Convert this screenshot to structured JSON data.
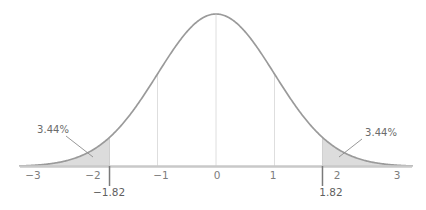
{
  "chart_data": {
    "type": "area",
    "title": "",
    "subtitle": "",
    "xlabel": "",
    "ylabel": "",
    "distribution": "standard-normal",
    "mean": 0,
    "sd": 1,
    "xlim": [
      -3.35,
      3.35
    ],
    "ylim": [
      0,
      0.42
    ],
    "grid": true,
    "grid_lines_at": [
      -1,
      0,
      1
    ],
    "legend": "none",
    "axis_ticks": [
      {
        "value": -3,
        "label": "−3"
      },
      {
        "value": -2,
        "label": "−2"
      },
      {
        "value": -1,
        "label": "−1"
      },
      {
        "value": 0,
        "label": "0"
      },
      {
        "value": 1,
        "label": "1"
      },
      {
        "value": 2,
        "label": "2"
      },
      {
        "value": 3,
        "label": "3"
      }
    ],
    "critical_values": [
      {
        "value": -1.82,
        "label": "−1.82"
      },
      {
        "value": 1.82,
        "label": "1.82"
      }
    ],
    "shaded_regions": [
      {
        "name": "left-tail",
        "from": -3.35,
        "to": -1.82,
        "area_percent": 3.44,
        "label": "3.44%"
      },
      {
        "name": "right-tail",
        "from": 1.82,
        "to": 3.35,
        "area_percent": 3.44,
        "label": "3.44%"
      }
    ],
    "annotations": [
      {
        "name": "left-tail-callout",
        "text": "3.44%",
        "points_to": -1.95
      },
      {
        "name": "right-tail-callout",
        "text": "3.44%",
        "points_to": 1.95
      }
    ],
    "colors": {
      "curve_stroke": "#9a9a9a",
      "tail_fill": "#d9d9d9",
      "axis": "#c9c9c9",
      "grid": "#dcdcdc",
      "tick_text": "#7d7d7d",
      "critical_text": "#5f5f5f",
      "critical_tick": "#7a7a7a",
      "annotation_text": "#6b6b6b",
      "leader_line": "#8c8c8c",
      "background": "#ffffff"
    }
  },
  "labels": {
    "tick_neg3": "−3",
    "tick_neg2": "−2",
    "tick_neg1": "−1",
    "tick_0": "0",
    "tick_1": "1",
    "tick_2": "2",
    "tick_3": "3",
    "crit_neg": "−1.82",
    "crit_pos": "1.82",
    "pct_left": "3.44%",
    "pct_right": "3.44%"
  }
}
